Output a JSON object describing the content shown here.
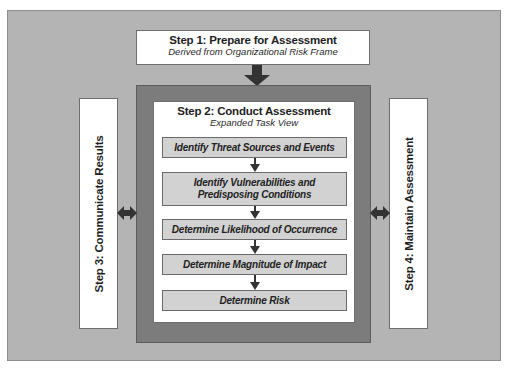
{
  "diagram": {
    "step1": {
      "title": "Step 1: Prepare for Assessment",
      "subtitle": "Derived from Organizational Risk Frame"
    },
    "step2": {
      "title": "Step 2: Conduct Assessment",
      "subtitle": "Expanded Task View",
      "tasks": [
        {
          "label": "Identify Threat Sources and Events"
        },
        {
          "label": "Identify Vulnerabilities and Predisposing Conditions"
        },
        {
          "label": "Determine Likelihood of Occurrence"
        },
        {
          "label": "Determine Magnitude of Impact"
        },
        {
          "label": "Determine Risk"
        }
      ]
    },
    "step3": {
      "title": "Step 3: Communicate Results"
    },
    "step4": {
      "title": "Step 4: Maintain Assessment"
    },
    "connectors": {
      "step1_to_step2": "down-arrow-icon",
      "step2_step3": "double-arrow-icon",
      "step2_step4": "double-arrow-icon",
      "task_flow": "down-arrow-icon"
    },
    "colors": {
      "background": "#b4b4b4",
      "step2_frame": "#7c7c7c",
      "task_fill": "#d2d2d2",
      "box_fill": "#ffffff",
      "arrow": "#333333"
    }
  }
}
